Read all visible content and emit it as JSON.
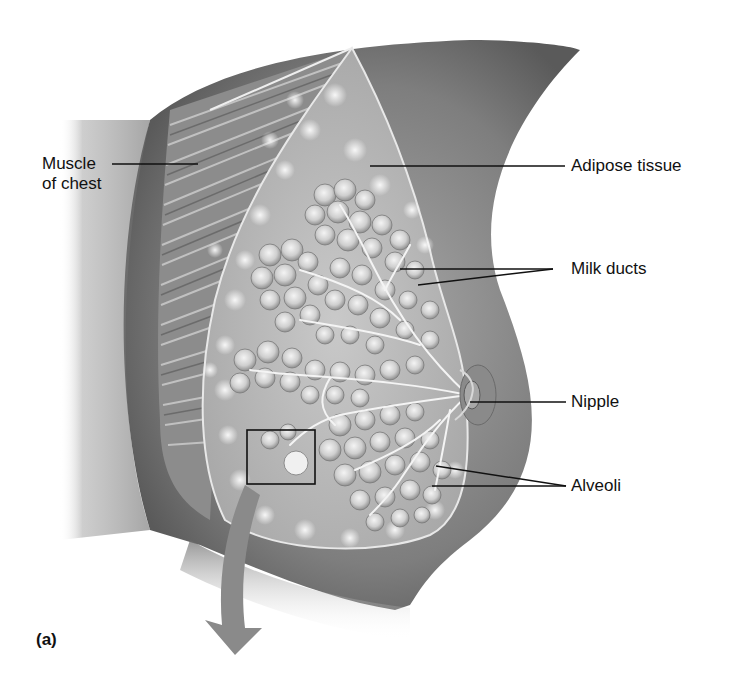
{
  "figure": {
    "panel_label": "(a)",
    "labels": [
      {
        "id": "muscle",
        "line1": "Muscle",
        "line2": "of chest"
      },
      {
        "id": "adipose",
        "text": "Adipose tissue"
      },
      {
        "id": "ducts",
        "text": "Milk ducts"
      },
      {
        "id": "nipple",
        "text": "Nipple"
      },
      {
        "id": "alveoli",
        "text": "Alveoli"
      }
    ],
    "colors": {
      "skin_dark": "#6e6e6e",
      "skin_mid": "#9a9a9a",
      "tissue": "#b9b9b9",
      "lobule": "#d6d6d6",
      "highlight": "#f2f2f2",
      "leader_line": "#111111",
      "arrow": "#8a8a8a"
    }
  }
}
